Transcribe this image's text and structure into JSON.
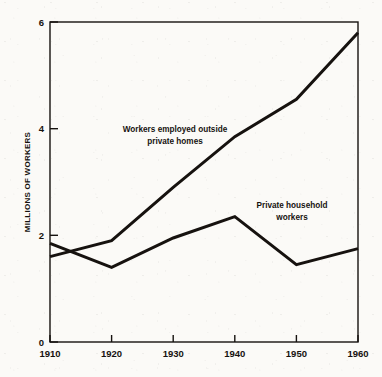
{
  "chart_data": {
    "type": "line",
    "title": "",
    "subtitle": "",
    "xlabel": "",
    "ylabel": "MILLIONS OF WORKERS",
    "xlim": [
      1910,
      1960
    ],
    "ylim": [
      0,
      6
    ],
    "grid": false,
    "legend_position": "inline-annotations",
    "x_ticks": [
      "1910",
      "1920",
      "1930",
      "1940",
      "1950",
      "1960"
    ],
    "x_tick_values": [
      1910,
      1920,
      1930,
      1940,
      1950,
      1960
    ],
    "y_ticks": [
      "0",
      "2",
      "4",
      "6"
    ],
    "y_tick_values": [
      0,
      2,
      4,
      6
    ],
    "series": [
      {
        "name": "Workers employed outside private homes",
        "x": [
          1910,
          1920,
          1930,
          1940,
          1950,
          1960
        ],
        "values": [
          1.6,
          1.9,
          2.9,
          3.85,
          4.55,
          5.8
        ]
      },
      {
        "name": "Private household workers",
        "x": [
          1910,
          1920,
          1930,
          1940,
          1950,
          1960
        ],
        "values": [
          1.85,
          1.4,
          1.95,
          2.35,
          1.45,
          1.75
        ]
      }
    ],
    "annotations": [
      {
        "id": "upper-series-label",
        "line1": "Workers employed outside",
        "line2": "private homes",
        "x": 1930,
        "y": 4.05
      },
      {
        "id": "lower-series-label",
        "line1": "Private household",
        "line2": "workers",
        "x": 1947,
        "y": 2.45
      }
    ]
  }
}
